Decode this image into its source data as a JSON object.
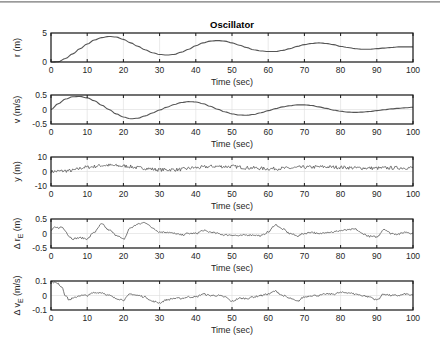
{
  "figure": {
    "title": "Oscillator",
    "line_color": "#555555",
    "grid_color": "#dcdcdc",
    "axis_color": "#1a1a1a"
  },
  "chart_data": [
    {
      "type": "line",
      "title": "Oscillator",
      "xlabel": "Time (sec)",
      "ylabel": "r (m)",
      "xlim": [
        0,
        100
      ],
      "ylim": [
        0,
        5
      ],
      "xticks": [
        0,
        10,
        20,
        30,
        40,
        50,
        60,
        70,
        80,
        90,
        100
      ],
      "yticks": [
        0,
        5
      ],
      "ytick_labels": [
        "0",
        "5"
      ],
      "grid": true,
      "x": [
        0,
        2,
        4,
        6,
        8,
        10,
        12,
        14,
        16,
        18,
        20,
        22,
        24,
        26,
        28,
        30,
        32,
        34,
        36,
        38,
        40,
        42,
        44,
        46,
        48,
        50,
        52,
        54,
        56,
        58,
        60,
        62,
        64,
        66,
        68,
        70,
        72,
        74,
        76,
        78,
        80,
        82,
        84,
        86,
        88,
        90,
        92,
        94,
        96,
        98,
        100
      ],
      "values": [
        0,
        0.05,
        0.6,
        1.4,
        2.3,
        3.1,
        3.8,
        4.2,
        4.4,
        4.3,
        3.9,
        3.3,
        2.7,
        2.1,
        1.6,
        1.3,
        1.2,
        1.3,
        1.7,
        2.2,
        2.8,
        3.3,
        3.6,
        3.7,
        3.6,
        3.3,
        2.9,
        2.5,
        2.1,
        1.9,
        1.8,
        1.8,
        2.0,
        2.3,
        2.7,
        3.0,
        3.2,
        3.3,
        3.2,
        3.0,
        2.7,
        2.5,
        2.3,
        2.2,
        2.2,
        2.3,
        2.4,
        2.5,
        2.6,
        2.6,
        2.6
      ]
    },
    {
      "type": "line",
      "xlabel": "Time (sec)",
      "ylabel": "v (m/s)",
      "xlim": [
        0,
        100
      ],
      "ylim": [
        -0.5,
        0.5
      ],
      "xticks": [
        0,
        10,
        20,
        30,
        40,
        50,
        60,
        70,
        80,
        90,
        100
      ],
      "yticks": [
        -0.5,
        0,
        0.5
      ],
      "ytick_labels": [
        "-0.5",
        "0",
        "0.5"
      ],
      "grid": true,
      "x": [
        0,
        2,
        4,
        6,
        8,
        10,
        12,
        14,
        16,
        18,
        20,
        22,
        24,
        26,
        28,
        30,
        32,
        34,
        36,
        38,
        40,
        42,
        44,
        46,
        48,
        50,
        52,
        54,
        56,
        58,
        60,
        62,
        64,
        66,
        68,
        70,
        72,
        74,
        76,
        78,
        80,
        82,
        84,
        86,
        88,
        90,
        92,
        94,
        96,
        98,
        100
      ],
      "values": [
        0,
        0.2,
        0.36,
        0.44,
        0.45,
        0.4,
        0.3,
        0.15,
        0,
        -0.15,
        -0.26,
        -0.32,
        -0.3,
        -0.22,
        -0.12,
        -0.02,
        0.08,
        0.17,
        0.24,
        0.27,
        0.26,
        0.2,
        0.11,
        0.01,
        -0.08,
        -0.15,
        -0.19,
        -0.2,
        -0.17,
        -0.11,
        -0.04,
        0.03,
        0.09,
        0.13,
        0.16,
        0.16,
        0.14,
        0.09,
        0.04,
        -0.02,
        -0.06,
        -0.09,
        -0.1,
        -0.09,
        -0.07,
        -0.04,
        -0.01,
        0.02,
        0.04,
        0.06,
        0.08
      ]
    },
    {
      "type": "line",
      "xlabel": "Time (sec)",
      "ylabel": "y (m)",
      "xlim": [
        0,
        100
      ],
      "ylim": [
        -10,
        10
      ],
      "xticks": [
        0,
        10,
        20,
        30,
        40,
        50,
        60,
        70,
        80,
        90,
        100
      ],
      "yticks": [
        -10,
        0,
        10
      ],
      "ytick_labels": [
        "-10",
        "0",
        "10"
      ],
      "grid": true,
      "noise": 1.2,
      "x": [
        0,
        5,
        10,
        15,
        20,
        25,
        30,
        35,
        40,
        45,
        50,
        55,
        60,
        65,
        70,
        75,
        80,
        85,
        90,
        95,
        100
      ],
      "values": [
        0,
        0.5,
        3,
        4.3,
        3.8,
        2.4,
        1.2,
        1.3,
        2.6,
        3.5,
        3.4,
        2.5,
        1.9,
        2.2,
        2.9,
        3.2,
        2.9,
        2.4,
        2.3,
        2.5,
        2.6
      ]
    },
    {
      "type": "line",
      "xlabel": "Time (sec)",
      "ylabel": "Δ r_E (m)",
      "xlim": [
        0,
        100
      ],
      "ylim": [
        -0.5,
        0.5
      ],
      "xticks": [
        0,
        10,
        20,
        30,
        40,
        50,
        60,
        70,
        80,
        90,
        100
      ],
      "yticks": [
        -0.5,
        0,
        0.5
      ],
      "ytick_labels": [
        "-0.5",
        "0",
        "0.5"
      ],
      "grid": true,
      "noise": 0.03,
      "x": [
        0,
        1,
        2,
        3,
        4,
        5,
        6,
        8,
        10,
        12,
        14,
        16,
        18,
        20,
        22,
        24,
        26,
        28,
        30,
        32,
        34,
        36,
        38,
        40,
        42,
        44,
        46,
        48,
        50,
        52,
        54,
        56,
        58,
        60,
        62,
        64,
        66,
        68,
        70,
        72,
        74,
        76,
        78,
        80,
        82,
        84,
        86,
        88,
        90,
        92,
        94,
        96,
        98,
        100
      ],
      "values": [
        0.1,
        0.2,
        0.2,
        0.22,
        0.1,
        -0.1,
        -0.18,
        -0.15,
        -0.18,
        0.05,
        0.32,
        0.12,
        -0.05,
        -0.2,
        0.2,
        0.32,
        0.38,
        0.2,
        0.05,
        0.05,
        0.0,
        -0.05,
        0.0,
        0.0,
        0.1,
        0.05,
        0.0,
        -0.05,
        -0.05,
        -0.08,
        -0.05,
        -0.05,
        -0.08,
        0.05,
        0.3,
        0.15,
        0.0,
        -0.08,
        0.0,
        0.05,
        -0.02,
        0.05,
        0.05,
        0.1,
        0.12,
        0.15,
        0.0,
        -0.1,
        -0.12,
        0.15,
        0.0,
        -0.02,
        0.05,
        0.0
      ]
    },
    {
      "type": "line",
      "xlabel": "Time (sec)",
      "ylabel": "Δ v_E (m/s)",
      "xlim": [
        0,
        100
      ],
      "ylim": [
        -0.1,
        0.1
      ],
      "xticks": [
        0,
        10,
        20,
        30,
        40,
        50,
        60,
        70,
        80,
        90,
        100
      ],
      "yticks": [
        -0.1,
        0,
        0.1
      ],
      "ytick_labels": [
        "-0.1",
        "0",
        "0.1"
      ],
      "grid": true,
      "noise": 0.006,
      "x": [
        0,
        1,
        2,
        3,
        4,
        5,
        6,
        8,
        10,
        12,
        14,
        16,
        18,
        20,
        22,
        24,
        26,
        28,
        30,
        32,
        34,
        36,
        38,
        40,
        42,
        44,
        46,
        48,
        50,
        52,
        54,
        56,
        58,
        60,
        62,
        64,
        66,
        68,
        70,
        72,
        74,
        76,
        78,
        80,
        82,
        84,
        86,
        88,
        90,
        92,
        94,
        96,
        98,
        100
      ],
      "values": [
        0.1,
        0.09,
        0.08,
        0.06,
        0.0,
        -0.03,
        -0.02,
        0.0,
        0.0,
        0.02,
        0.02,
        0.0,
        -0.02,
        -0.03,
        0.01,
        0.0,
        -0.01,
        -0.04,
        -0.05,
        -0.03,
        -0.02,
        -0.02,
        -0.01,
        -0.01,
        0.01,
        0.0,
        0.0,
        -0.01,
        -0.04,
        -0.02,
        -0.02,
        -0.01,
        0.0,
        0.01,
        0.03,
        0.0,
        -0.02,
        -0.04,
        -0.01,
        0.0,
        0.0,
        0.01,
        0.01,
        0.02,
        0.02,
        0.01,
        0.0,
        -0.01,
        -0.03,
        0.01,
        0.0,
        0.0,
        0.01,
        0.0
      ]
    }
  ]
}
